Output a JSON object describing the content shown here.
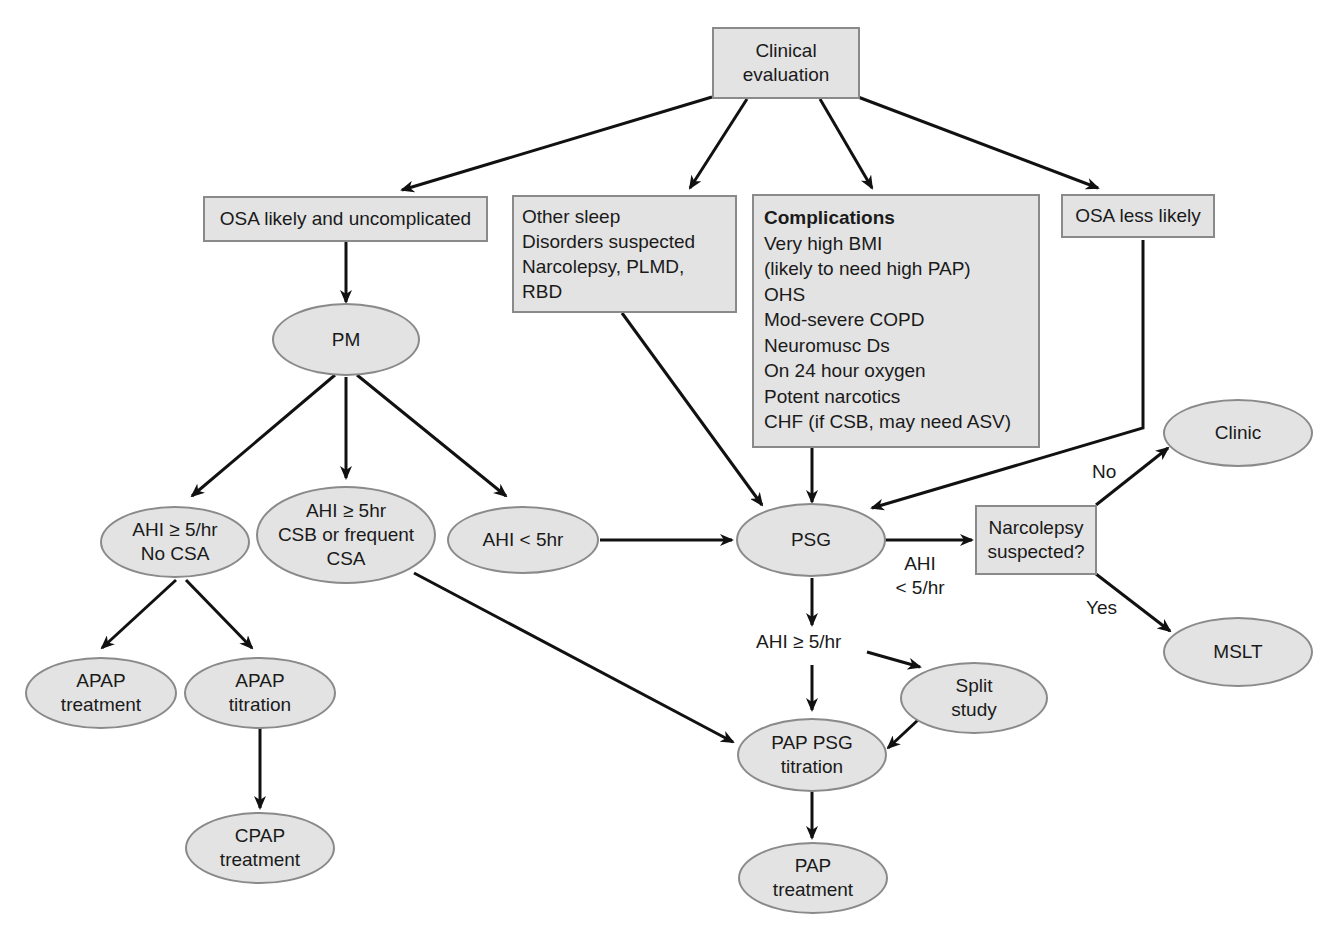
{
  "diagram": {
    "type": "flowchart",
    "nodes": {
      "clinical_evaluation": {
        "shape": "rect",
        "lines": [
          "Clinical",
          "evaluation"
        ]
      },
      "osa_likely": {
        "shape": "rect",
        "lines": [
          "OSA likely and uncomplicated"
        ]
      },
      "other_sleep": {
        "shape": "rect",
        "lines": [
          "Other sleep",
          "Disorders suspected",
          "Narcolepsy, PLMD,",
          "RBD"
        ]
      },
      "complications": {
        "shape": "rect",
        "title": "Complications",
        "lines": [
          "Very high BMI",
          "(likely to need high PAP)",
          "OHS",
          "Mod-severe COPD",
          "Neuromusc Ds",
          "On 24 hour oxygen",
          "Potent narcotics",
          "CHF (if CSB, may need ASV)"
        ]
      },
      "osa_less_likely": {
        "shape": "rect",
        "lines": [
          "OSA less likely"
        ]
      },
      "pm": {
        "shape": "oval",
        "lines": [
          "PM"
        ]
      },
      "ahi_ge5_no_csa": {
        "shape": "oval",
        "lines": [
          "AHI ≥ 5/hr",
          "No CSA"
        ]
      },
      "ahi_ge5_csb": {
        "shape": "oval",
        "lines": [
          "AHI ≥ 5hr",
          "CSB or frequent",
          "CSA"
        ]
      },
      "ahi_lt5": {
        "shape": "oval",
        "lines": [
          "AHI < 5hr"
        ]
      },
      "psg": {
        "shape": "oval",
        "lines": [
          "PSG"
        ]
      },
      "narcolepsy_suspected": {
        "shape": "rect",
        "lines": [
          "Narcolepsy",
          "suspected?"
        ]
      },
      "clinic": {
        "shape": "oval",
        "lines": [
          "Clinic"
        ]
      },
      "mslt": {
        "shape": "oval",
        "lines": [
          "MSLT"
        ]
      },
      "apap_treatment": {
        "shape": "oval",
        "lines": [
          "APAP",
          "treatment"
        ]
      },
      "apap_titration": {
        "shape": "oval",
        "lines": [
          "APAP",
          "titration"
        ]
      },
      "cpap_treatment": {
        "shape": "oval",
        "lines": [
          "CPAP",
          "treatment"
        ]
      },
      "split_study": {
        "shape": "oval",
        "lines": [
          "Split",
          "study"
        ]
      },
      "pap_psg_titration": {
        "shape": "oval",
        "lines": [
          "PAP PSG",
          "titration"
        ]
      },
      "pap_treatment": {
        "shape": "oval",
        "lines": [
          "PAP",
          "treatment"
        ]
      }
    },
    "edge_labels": {
      "psg_narcolepsy": [
        "AHI",
        "< 5/hr"
      ],
      "psg_down": "AHI ≥ 5/hr",
      "no": "No",
      "yes": "Yes"
    },
    "edges": [
      [
        "clinical_evaluation",
        "osa_likely"
      ],
      [
        "clinical_evaluation",
        "other_sleep"
      ],
      [
        "clinical_evaluation",
        "complications"
      ],
      [
        "clinical_evaluation",
        "osa_less_likely"
      ],
      [
        "osa_likely",
        "pm"
      ],
      [
        "pm",
        "ahi_ge5_no_csa"
      ],
      [
        "pm",
        "ahi_ge5_csb"
      ],
      [
        "pm",
        "ahi_lt5"
      ],
      [
        "other_sleep",
        "psg"
      ],
      [
        "complications",
        "psg"
      ],
      [
        "osa_less_likely",
        "psg"
      ],
      [
        "ahi_lt5",
        "psg"
      ],
      [
        "ahi_ge5_csb",
        "pap_psg_titration"
      ],
      [
        "ahi_ge5_no_csa",
        "apap_treatment"
      ],
      [
        "ahi_ge5_no_csa",
        "apap_titration"
      ],
      [
        "apap_titration",
        "cpap_treatment"
      ],
      [
        "psg",
        "narcolepsy_suspected",
        "AHI < 5/hr"
      ],
      [
        "narcolepsy_suspected",
        "clinic",
        "No"
      ],
      [
        "narcolepsy_suspected",
        "mslt",
        "Yes"
      ],
      [
        "psg",
        "pap_psg_titration",
        "AHI ≥ 5/hr"
      ],
      [
        "psg",
        "split_study",
        "AHI ≥ 5/hr"
      ],
      [
        "split_study",
        "pap_psg_titration"
      ],
      [
        "pap_psg_titration",
        "pap_treatment"
      ]
    ],
    "colors": {
      "fill": "#e3e3e3",
      "border": "#8a8a8a",
      "arrow": "#111111",
      "text": "#1a1a1a"
    }
  }
}
